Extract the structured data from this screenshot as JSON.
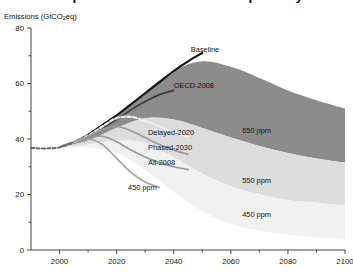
{
  "chart_title": "Comparison of GHG emissions pathways",
  "y_axis_title_main": "Emissions (GtCO",
  "y_axis_title_sub": "2",
  "y_axis_title_tail": "eq)",
  "chart_data": {
    "type": "line",
    "title": "Comparison of GHG emissions pathways",
    "xlabel": "",
    "ylabel": "Emissions (GtCO2eq)",
    "xlim": [
      1990,
      2100
    ],
    "ylim": [
      0,
      80
    ],
    "x_ticks": [
      2000,
      2020,
      2040,
      2060,
      2080,
      2100
    ],
    "x_minor_ticks": [
      2010,
      2030,
      2050,
      2070,
      2090
    ],
    "y_ticks": [
      0,
      20,
      40,
      60,
      80
    ],
    "y_minor_ticks": [
      10,
      30,
      50,
      70
    ],
    "grid": false,
    "legend": "inline-annotations",
    "bands": [
      {
        "name": "650 ppm",
        "label": "650 ppm",
        "color": "#8c8c8c",
        "label_x": 2064,
        "label_y": 42,
        "x": [
          2000,
          2010,
          2020,
          2030,
          2040,
          2050,
          2060,
          2070,
          2080,
          2090,
          2100
        ],
        "upper": [
          37.5,
          41.5,
          48.0,
          57.0,
          64.5,
          68.0,
          66.0,
          62.0,
          57.5,
          54.0,
          51.0
        ],
        "lower": [
          37.0,
          39.5,
          44.0,
          47.5,
          47.0,
          44.0,
          40.5,
          37.5,
          35.0,
          33.0,
          31.5
        ]
      },
      {
        "name": "550 ppm",
        "label": "550 ppm",
        "color": "#dddddd",
        "label_x": 2064,
        "label_y": 24,
        "x": [
          2000,
          2010,
          2020,
          2030,
          2040,
          2050,
          2060,
          2070,
          2080,
          2090,
          2100
        ],
        "upper": [
          37.0,
          39.5,
          44.0,
          47.5,
          47.0,
          44.0,
          40.5,
          37.5,
          35.0,
          33.0,
          31.5
        ],
        "lower": [
          36.8,
          38.0,
          39.5,
          38.5,
          33.5,
          27.5,
          23.0,
          20.0,
          18.0,
          17.0,
          16.0
        ]
      },
      {
        "name": "450 ppm",
        "label": "450 ppm",
        "color": "#f1f1f1",
        "label_x": 2064,
        "label_y": 12,
        "x": [
          2000,
          2010,
          2020,
          2030,
          2040,
          2050,
          2060,
          2070,
          2080,
          2090,
          2100
        ],
        "upper": [
          36.8,
          38.0,
          39.5,
          38.5,
          33.5,
          27.5,
          23.0,
          20.0,
          18.0,
          17.0,
          16.0
        ],
        "lower": [
          36.5,
          37.0,
          35.0,
          29.0,
          21.0,
          14.0,
          9.5,
          7.0,
          5.5,
          4.5,
          4.0
        ]
      }
    ],
    "series": [
      {
        "name": "Historical",
        "label": "",
        "style": "dashed",
        "color": "#666666",
        "width": 1.9,
        "x": [
          1990,
          1995,
          2000,
          2005
        ],
        "values": [
          36.8,
          36.6,
          37.0,
          38.8
        ]
      },
      {
        "name": "Baseline",
        "label": "Baseline",
        "style": "solid",
        "color": "#111111",
        "width": 2.1,
        "label_x": 2046,
        "label_y": 71.5,
        "x": [
          2005,
          2010,
          2015,
          2020,
          2025,
          2030,
          2035,
          2040,
          2045,
          2050
        ],
        "values": [
          38.8,
          41.5,
          45.0,
          48.5,
          52.5,
          56.5,
          60.5,
          64.5,
          68.0,
          71.0
        ]
      },
      {
        "name": "OECD-2008",
        "label": "OECD-2008",
        "style": "solid",
        "color": "#3a3a3a",
        "width": 1.7,
        "label_x": 2040,
        "label_y": 58.5,
        "x": [
          2005,
          2010,
          2015,
          2020,
          2025,
          2030,
          2035,
          2040
        ],
        "values": [
          38.8,
          41.0,
          44.0,
          47.0,
          50.5,
          53.5,
          56.0,
          57.5
        ]
      },
      {
        "name": "Delayed-2020",
        "label": "Delayed-2020",
        "style": "dashed-white",
        "color": "#f2f2f2",
        "width": 2.2,
        "label_x": 2031,
        "label_y": 41.5,
        "x": [
          2005,
          2010,
          2015,
          2020,
          2025,
          2030,
          2035,
          2040,
          2045
        ],
        "values": [
          38.8,
          41.2,
          44.5,
          47.5,
          48.0,
          46.5,
          44.5,
          42.5,
          41.0
        ]
      },
      {
        "name": "Phased-2030",
        "label": "Phased-2030",
        "style": "solid",
        "color": "#9a9a9a",
        "width": 1.7,
        "label_x": 2031,
        "label_y": 36.0,
        "x": [
          2005,
          2010,
          2015,
          2020,
          2025,
          2030,
          2035,
          2040,
          2045
        ],
        "values": [
          38.8,
          41.0,
          43.5,
          44.5,
          43.0,
          40.5,
          38.0,
          36.0,
          34.5
        ]
      },
      {
        "name": "All-2008",
        "label": "All-2008",
        "style": "solid",
        "color": "#9a9a9a",
        "width": 1.7,
        "label_x": 2031,
        "label_y": 30.5,
        "x": [
          2005,
          2010,
          2015,
          2020,
          2025,
          2030,
          2035,
          2040,
          2045
        ],
        "values": [
          38.8,
          40.5,
          41.0,
          39.0,
          36.0,
          33.5,
          31.5,
          30.0,
          29.0
        ]
      },
      {
        "name": "450 ppm line",
        "label": "450 ppm",
        "style": "solid",
        "color": "#a5a5a5",
        "width": 1.7,
        "label_x": 2024,
        "label_y": 21.5,
        "x": [
          2005,
          2010,
          2015,
          2020,
          2025,
          2030,
          2035
        ],
        "values": [
          38.8,
          40.0,
          38.0,
          33.0,
          28.0,
          24.5,
          22.5
        ]
      }
    ]
  },
  "axis": {
    "x_tick_labels": [
      "2000",
      "2020",
      "2040",
      "2060",
      "2080",
      "2100"
    ],
    "y_tick_labels": [
      "0",
      "20",
      "40",
      "60",
      "80"
    ]
  }
}
